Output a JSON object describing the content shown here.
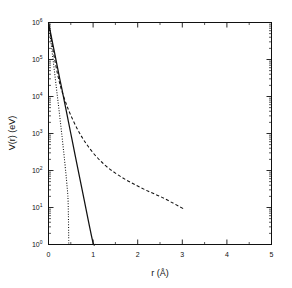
{
  "figure": {
    "background": "#ffffff",
    "foreground": "#111111"
  },
  "chart_data": {
    "type": "line",
    "title": "",
    "xlabel": "r (Å)",
    "ylabel": "V(r) (eV)",
    "xlim": [
      0,
      5
    ],
    "ylim": [
      1,
      1000000
    ],
    "yscale": "log",
    "xscale": "linear",
    "grid": false,
    "legend": "none",
    "xticks": [
      0,
      1,
      2,
      3,
      4,
      5
    ],
    "xtick_labels": [
      "0",
      "1",
      "2",
      "3",
      "4",
      "5"
    ],
    "xminor_ticks": [
      0.5,
      1.5,
      2.5,
      3.5,
      4.5
    ],
    "yticks": [
      1,
      10,
      100,
      1000,
      10000,
      100000,
      1000000
    ],
    "ytick_labels": [
      "10⁰",
      "10¹",
      "10²",
      "10³",
      "10⁴",
      "10⁵",
      "10⁶"
    ],
    "ytick_mantissa": "10",
    "ytick_exponents": [
      "0",
      "1",
      "2",
      "3",
      "4",
      "5",
      "6"
    ],
    "series": [
      {
        "name": "dotted-curve",
        "style": "dotted",
        "color": "#111111",
        "x": [
          0.0,
          0.02,
          0.05,
          0.08,
          0.11,
          0.14,
          0.17,
          0.2,
          0.23,
          0.26,
          0.29,
          0.32,
          0.35,
          0.38,
          0.41,
          0.44,
          0.455
        ],
        "y": [
          1000000,
          660000,
          330000,
          165000,
          82000,
          41000,
          20000,
          10000,
          5000,
          2400,
          1150,
          540,
          250,
          110,
          45,
          14,
          1.0
        ]
      },
      {
        "name": "solid-curve",
        "style": "solid",
        "color": "#111111",
        "x": [
          0.0,
          0.05,
          0.1,
          0.15,
          0.2,
          0.25,
          0.3,
          0.4,
          0.5,
          0.6,
          0.7,
          0.8,
          0.9,
          1.0,
          1.045
        ],
        "y": [
          1000000,
          500000,
          250000,
          125000,
          62000,
          31000,
          16000,
          4000,
          1000,
          250,
          63,
          16,
          4.0,
          1.1,
          1.0
        ]
      },
      {
        "name": "dashed-curve",
        "style": "dashed",
        "color": "#111111",
        "x": [
          0.0,
          0.05,
          0.1,
          0.15,
          0.2,
          0.25,
          0.3,
          0.4,
          0.5,
          0.65,
          0.8,
          1.0,
          1.25,
          1.5,
          1.75,
          2.0,
          2.25,
          2.5,
          2.75,
          3.0,
          3.05
        ],
        "y": [
          1000000,
          430000,
          185000,
          85000,
          42000,
          23000,
          14000,
          6200,
          3100,
          1300,
          640,
          300,
          145,
          85,
          55,
          38,
          27,
          20,
          14,
          9.6,
          9.0
        ]
      }
    ]
  },
  "axes": {
    "x_title": "r (Å)",
    "y_title": "V(r) (eV)"
  }
}
